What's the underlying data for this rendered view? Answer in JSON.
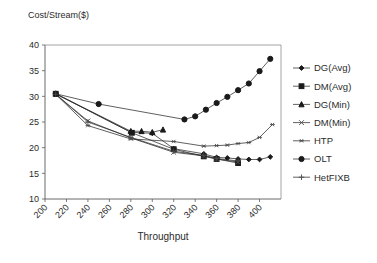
{
  "chart_data": {
    "type": "line",
    "title": "",
    "ylabel": "Cost/Stream($)",
    "xlabel": "Throughput",
    "xlim": [
      200,
      420
    ],
    "ylim": [
      10,
      40
    ],
    "xticks": [
      200,
      220,
      240,
      260,
      280,
      300,
      320,
      340,
      360,
      380,
      400
    ],
    "yticks": [
      10,
      15,
      20,
      25,
      30,
      35,
      40
    ],
    "grid": false,
    "legend_position": "right",
    "xtick_rotation": -45,
    "series": [
      {
        "name": "DG(Avg)",
        "marker": "diamond",
        "color": "#1a1a1a",
        "x": [
          210,
          280,
          300,
          320,
          348,
          360,
          370,
          380,
          390,
          400,
          410
        ],
        "y": [
          30.5,
          23.0,
          22.8,
          19.8,
          18.8,
          18.1,
          18.0,
          17.8,
          17.7,
          17.7,
          18.2
        ]
      },
      {
        "name": "DM(Avg)",
        "marker": "square",
        "color": "#1a1a1a",
        "x": [
          210,
          281,
          320,
          348,
          360,
          380
        ],
        "y": [
          30.5,
          22.9,
          19.7,
          18.3,
          17.8,
          17.0
        ]
      },
      {
        "name": "DG(Min)",
        "marker": "triangle",
        "color": "#1a1a1a",
        "x": [
          210,
          280,
          290,
          300,
          310
        ],
        "y": [
          30.5,
          23.2,
          23.2,
          23.0,
          23.5
        ]
      },
      {
        "name": "DM(Min)",
        "marker": "x",
        "color": "#4a4a4a",
        "x": [
          210,
          240,
          280,
          320,
          348,
          360,
          380
        ],
        "y": [
          30.4,
          25.2,
          21.9,
          19.1,
          18.4,
          17.8,
          17.2
        ]
      },
      {
        "name": "HTP",
        "marker": "asterisk",
        "color": "#4a4a4a",
        "x": [
          210,
          240,
          280,
          320,
          348,
          360,
          370,
          380,
          390,
          400,
          412
        ],
        "y": [
          30.4,
          24.3,
          21.7,
          21.2,
          20.3,
          20.4,
          20.5,
          20.8,
          21.0,
          22.0,
          24.5
        ]
      },
      {
        "name": "OLT",
        "marker": "circle",
        "color": "#1a1a1a",
        "x": [
          210,
          250,
          330,
          340,
          350,
          360,
          370,
          380,
          390,
          400,
          410
        ],
        "y": [
          30.5,
          28.5,
          25.5,
          26.1,
          27.4,
          28.7,
          29.9,
          31.2,
          32.5,
          34.9,
          37.3
        ]
      },
      {
        "name": "HetFIXB",
        "marker": "plus",
        "color": "#4a4a4a",
        "x": [
          210,
          240,
          280,
          320,
          348,
          360,
          380
        ],
        "y": [
          30.4,
          25.0,
          22.0,
          19.3,
          18.5,
          17.9,
          17.4
        ]
      }
    ]
  },
  "legend": {
    "items": [
      {
        "label": "DG(Avg)",
        "marker": "diamond"
      },
      {
        "label": "DM(Avg)",
        "marker": "square"
      },
      {
        "label": "DG(Min)",
        "marker": "triangle"
      },
      {
        "label": "DM(Min)",
        "marker": "x"
      },
      {
        "label": "HTP",
        "marker": "asterisk"
      },
      {
        "label": "OLT",
        "marker": "circle"
      },
      {
        "label": "HetFIXB",
        "marker": "plus"
      }
    ]
  }
}
